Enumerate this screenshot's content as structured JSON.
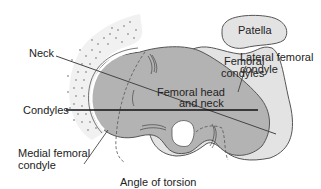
{
  "diagram": {
    "caption": "Angle of torsion",
    "labels": {
      "patella": "Patella",
      "femoral_condyles_1": "Femoral",
      "femoral_condyles_2": "condyles",
      "lateral_condyle_1": "Lateral femoral",
      "lateral_condyle_2": "condyle",
      "neck": "Neck",
      "femoral_head_1": "Femoral head",
      "femoral_head_2": "and neck",
      "condyles": "Condyles",
      "medial_condyle_1": "Medial femoral",
      "medial_condyle_2": "condyle"
    },
    "colors": {
      "light_fill": "#e3e3e3",
      "dark_fill": "#b3b3b3",
      "outline": "#555555",
      "stipple": "#9a9a9a",
      "axis_line": "#111111"
    }
  }
}
